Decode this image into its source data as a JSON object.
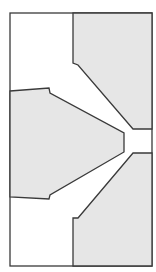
{
  "diagram": {
    "type": "cross-section-outline",
    "canvas": {
      "width": 156,
      "height": 272,
      "background": "#ffffff"
    },
    "colors": {
      "fill": "#e6e6e6",
      "stroke": "#3a3a3a",
      "frame_fill": "#ffffff"
    },
    "stroke_width": 1.3,
    "frame": {
      "x": 10,
      "y": 13,
      "width": 142,
      "height": 253
    },
    "regions": [
      {
        "name": "upper-right-block",
        "points": "73,13 152,13 152,129 133,129 78,65 73,63"
      },
      {
        "name": "middle-left-block",
        "points": "10,91 49,88 50,93 124,133 124,152 50,195 49,199 10,197"
      },
      {
        "name": "lower-right-block",
        "points": "73,266 152,266 152,153 133,153 78,218 73,218"
      }
    ]
  }
}
